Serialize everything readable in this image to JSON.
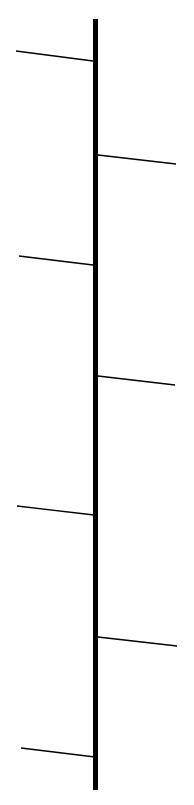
{
  "diagram": {
    "type": "timeline-branches",
    "canvas": {
      "width": 194,
      "height": 805,
      "background": "#ffffff"
    },
    "stroke_color": "#000000",
    "trunk": {
      "x": 95.5,
      "y1": 19,
      "y2": 790,
      "width": 5
    },
    "branch_width": 1.3,
    "branches": [
      {
        "side": "left",
        "x1": 16,
        "y1": 51,
        "x2": 93,
        "y2": 61
      },
      {
        "side": "right",
        "x1": 98,
        "y1": 155,
        "x2": 176,
        "y2": 164
      },
      {
        "side": "left",
        "x1": 19,
        "y1": 256,
        "x2": 93,
        "y2": 265
      },
      {
        "side": "right",
        "x1": 98,
        "y1": 376,
        "x2": 175,
        "y2": 385
      },
      {
        "side": "left",
        "x1": 17,
        "y1": 506,
        "x2": 94,
        "y2": 515
      },
      {
        "side": "right",
        "x1": 98,
        "y1": 637,
        "x2": 177,
        "y2": 646
      },
      {
        "side": "left",
        "x1": 21,
        "y1": 748,
        "x2": 95,
        "y2": 757
      }
    ]
  }
}
